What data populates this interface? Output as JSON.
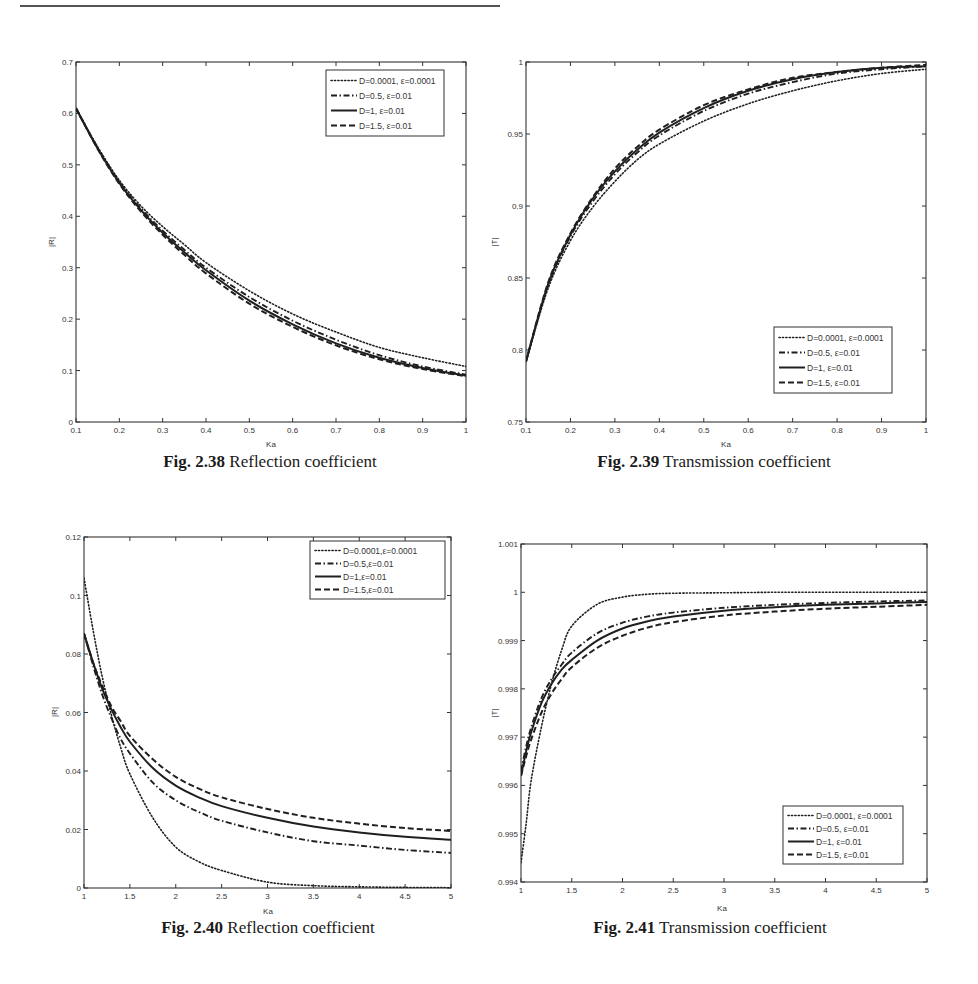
{
  "page": {
    "top_rule": true
  },
  "captions": [
    {
      "bold": "Fig. 2.38",
      "text": " Reflection coefficient"
    },
    {
      "bold": "Fig. 2.39",
      "text": " Transmission coefficient"
    },
    {
      "bold": "Fig. 2.40",
      "text": " Reflection coefficient"
    },
    {
      "bold": "Fig. 2.41",
      "text": " Transmission coefficient"
    }
  ],
  "chart_data": [
    {
      "type": "line",
      "figure": "Fig. 2.38",
      "title": "Reflection coefficient",
      "xlabel": "Ka",
      "ylabel": "|R|",
      "xlim": [
        0.1,
        1
      ],
      "ylim": [
        0,
        0.7
      ],
      "xticks": [
        "0.1",
        "0.2",
        "0.3",
        "0.4",
        "0.5",
        "0.6",
        "0.7",
        "0.8",
        "0.9",
        "1"
      ],
      "yticks": [
        "0",
        "0.1",
        "0.2",
        "0.3",
        "0.4",
        "0.5",
        "0.6",
        "0.7"
      ],
      "grid": false,
      "legend_position": "upper right",
      "x": [
        0.1,
        0.15,
        0.2,
        0.25,
        0.3,
        0.35,
        0.4,
        0.5,
        0.6,
        0.7,
        0.8,
        0.9,
        1.0
      ],
      "series": [
        {
          "name": "D=0.0001, ε=0.0001",
          "style": "dotted",
          "values": [
            0.61,
            0.535,
            0.47,
            0.42,
            0.38,
            0.345,
            0.31,
            0.255,
            0.21,
            0.175,
            0.145,
            0.125,
            0.108
          ]
        },
        {
          "name": "D=0.5, ε=0.01",
          "style": "dashdot",
          "values": [
            0.61,
            0.533,
            0.467,
            0.415,
            0.372,
            0.335,
            0.3,
            0.243,
            0.197,
            0.16,
            0.13,
            0.108,
            0.092
          ]
        },
        {
          "name": "D=1, ε=0.01",
          "style": "solid",
          "values": [
            0.61,
            0.532,
            0.465,
            0.412,
            0.368,
            0.33,
            0.295,
            0.236,
            0.19,
            0.153,
            0.125,
            0.105,
            0.09
          ]
        },
        {
          "name": "D=1.5, ε=0.01",
          "style": "dashed",
          "values": [
            0.61,
            0.531,
            0.463,
            0.409,
            0.364,
            0.325,
            0.289,
            0.23,
            0.185,
            0.149,
            0.122,
            0.103,
            0.089
          ]
        }
      ]
    },
    {
      "type": "line",
      "figure": "Fig. 2.39",
      "title": "Transmission coefficient",
      "xlabel": "Ka",
      "ylabel": "|T|",
      "xlim": [
        0.1,
        1
      ],
      "ylim": [
        0.75,
        1
      ],
      "xticks": [
        "0.1",
        "0.2",
        "0.3",
        "0.4",
        "0.5",
        "0.6",
        "0.7",
        "0.8",
        "0.9",
        "1"
      ],
      "yticks": [
        "0.75",
        "0.8",
        "0.85",
        "0.9",
        "0.95",
        "1"
      ],
      "grid": false,
      "legend_position": "lower right",
      "x": [
        0.1,
        0.15,
        0.2,
        0.25,
        0.3,
        0.35,
        0.4,
        0.5,
        0.6,
        0.7,
        0.8,
        0.9,
        1.0
      ],
      "series": [
        {
          "name": "D=0.0001, ε=0.0001",
          "style": "dotted",
          "values": [
            0.792,
            0.843,
            0.876,
            0.899,
            0.917,
            0.932,
            0.943,
            0.959,
            0.971,
            0.98,
            0.987,
            0.992,
            0.995
          ]
        },
        {
          "name": "D=0.5, ε=0.01",
          "style": "dashdot",
          "values": [
            0.792,
            0.845,
            0.879,
            0.903,
            0.922,
            0.937,
            0.949,
            0.966,
            0.978,
            0.986,
            0.992,
            0.995,
            0.997
          ]
        },
        {
          "name": "D=1, ε=0.01",
          "style": "solid",
          "values": [
            0.792,
            0.846,
            0.88,
            0.905,
            0.924,
            0.939,
            0.951,
            0.968,
            0.98,
            0.988,
            0.993,
            0.996,
            0.997
          ]
        },
        {
          "name": "D=1.5, ε=0.01",
          "style": "dashed",
          "values": [
            0.792,
            0.847,
            0.881,
            0.906,
            0.926,
            0.941,
            0.953,
            0.97,
            0.981,
            0.989,
            0.993,
            0.996,
            0.998
          ]
        }
      ]
    },
    {
      "type": "line",
      "figure": "Fig. 2.40",
      "title": "Reflection coefficient",
      "xlabel": "Ka",
      "ylabel": "|R|",
      "xlim": [
        1,
        5
      ],
      "ylim": [
        0,
        0.12
      ],
      "xticks": [
        "1",
        "1.5",
        "2",
        "2.5",
        "3",
        "3.5",
        "4",
        "4.5",
        "5"
      ],
      "yticks": [
        "0",
        "0.02",
        "0.04",
        "0.06",
        "0.08",
        "0.1",
        "0.12"
      ],
      "grid": false,
      "legend_position": "upper right",
      "x": [
        1.0,
        1.1,
        1.2,
        1.3,
        1.4,
        1.5,
        1.75,
        2.0,
        2.25,
        2.5,
        3.0,
        3.5,
        4.0,
        4.5,
        5.0
      ],
      "series": [
        {
          "name": "D=0.0001,ε=0.0001",
          "style": "dotted",
          "values": [
            0.106,
            0.088,
            0.072,
            0.059,
            0.048,
            0.039,
            0.024,
            0.014,
            0.009,
            0.006,
            0.002,
            0.0008,
            0.0004,
            0.0002,
            0.0001
          ]
        },
        {
          "name": "D=0.5,ε=0.01",
          "style": "dashdot",
          "values": [
            0.087,
            0.076,
            0.066,
            0.058,
            0.051,
            0.046,
            0.036,
            0.03,
            0.026,
            0.023,
            0.019,
            0.016,
            0.0145,
            0.013,
            0.012
          ]
        },
        {
          "name": "D=1,ε=0.01",
          "style": "solid",
          "values": [
            0.087,
            0.077,
            0.068,
            0.061,
            0.055,
            0.05,
            0.041,
            0.035,
            0.031,
            0.028,
            0.024,
            0.021,
            0.019,
            0.0175,
            0.0165
          ]
        },
        {
          "name": "D=1.5,ε=0.01",
          "style": "dashed",
          "values": [
            0.087,
            0.077,
            0.069,
            0.062,
            0.057,
            0.052,
            0.044,
            0.038,
            0.034,
            0.031,
            0.027,
            0.024,
            0.022,
            0.0205,
            0.0195
          ]
        }
      ]
    },
    {
      "type": "line",
      "figure": "Fig. 2.41",
      "title": "Transmission coefficient",
      "xlabel": "Ka",
      "ylabel": "|T|",
      "xlim": [
        1,
        5
      ],
      "ylim": [
        0.994,
        1.001
      ],
      "xticks": [
        "1",
        "1.5",
        "2",
        "2.5",
        "3",
        "3.5",
        "4",
        "4.5",
        "5"
      ],
      "yticks": [
        "0.994",
        "0.995",
        "0.996",
        "0.997",
        "0.998",
        "0.999",
        "1",
        "1.001"
      ],
      "grid": false,
      "legend_position": "lower right",
      "x": [
        1.0,
        1.05,
        1.1,
        1.2,
        1.3,
        1.4,
        1.5,
        1.75,
        2.0,
        2.25,
        2.5,
        3.0,
        3.5,
        4.0,
        4.5,
        5.0
      ],
      "series": [
        {
          "name": "D=0.0001, ε=0.0001",
          "style": "dotted",
          "values": [
            0.9944,
            0.9952,
            0.9961,
            0.9972,
            0.9981,
            0.9988,
            0.9993,
            0.99975,
            0.9999,
            0.99996,
            0.99998,
            0.99999,
            1.0,
            1.0,
            1.0,
            1.0
          ]
        },
        {
          "name": "D=0.5, ε=0.01",
          "style": "dashdot",
          "values": [
            0.9963,
            0.9968,
            0.9972,
            0.9978,
            0.9982,
            0.9985,
            0.99875,
            0.99915,
            0.99937,
            0.9995,
            0.99958,
            0.99968,
            0.99974,
            0.99978,
            0.99981,
            0.99983
          ]
        },
        {
          "name": "D=1, ε=0.01",
          "style": "solid",
          "values": [
            0.9962,
            0.9967,
            0.9971,
            0.9977,
            0.9981,
            0.9984,
            0.9986,
            0.999,
            0.99925,
            0.9994,
            0.9995,
            0.99962,
            0.99969,
            0.99974,
            0.99977,
            0.9998
          ]
        },
        {
          "name": "D=1.5, ε=0.01",
          "style": "dashed",
          "values": [
            0.9962,
            0.9966,
            0.99695,
            0.9975,
            0.9979,
            0.9982,
            0.99845,
            0.99885,
            0.9991,
            0.99927,
            0.99938,
            0.99952,
            0.9996,
            0.99966,
            0.9997,
            0.99974
          ]
        }
      ]
    }
  ]
}
